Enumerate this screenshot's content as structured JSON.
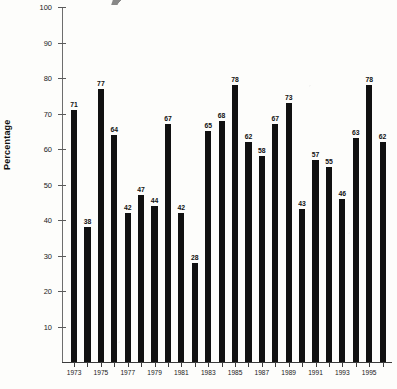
{
  "chart_data": {
    "type": "bar",
    "title": "",
    "xlabel": "",
    "ylabel": "Percentage",
    "ylim": [
      0,
      100
    ],
    "ytick_step": 10,
    "yticks": [
      0,
      10,
      20,
      30,
      40,
      50,
      60,
      70,
      80,
      90,
      100
    ],
    "grid": false,
    "legend": "none",
    "bar_color": "#111111",
    "categories": [
      "1973",
      "1974",
      "1975",
      "1976",
      "1977",
      "1978",
      "1979",
      "1980",
      "1981",
      "1982",
      "1983",
      "1984",
      "1985",
      "1986",
      "1987",
      "1988",
      "1989",
      "1990",
      "1991",
      "1992",
      "1993",
      "1994",
      "1995",
      "1996"
    ],
    "values": [
      71,
      38,
      77,
      64,
      42,
      47,
      44,
      67,
      42,
      28,
      65,
      68,
      78,
      62,
      58,
      67,
      73,
      43,
      57,
      55,
      46,
      63,
      78,
      62
    ],
    "value_labels": [
      "71",
      "38",
      "77",
      "64",
      "42",
      "47",
      "44",
      "67",
      "42",
      "28",
      "65",
      "68",
      "78",
      "62",
      "58",
      "67",
      "73",
      "43",
      "57",
      "55",
      "46",
      "63",
      "78",
      "62"
    ],
    "xtick_labels": [
      "1973",
      "1975",
      "1977",
      "1979",
      "1981",
      "1983",
      "1985",
      "1987",
      "1989",
      "1991",
      "1993",
      "1995"
    ],
    "xtick_indices": [
      0,
      2,
      4,
      6,
      8,
      10,
      12,
      14,
      16,
      18,
      20,
      22
    ]
  }
}
